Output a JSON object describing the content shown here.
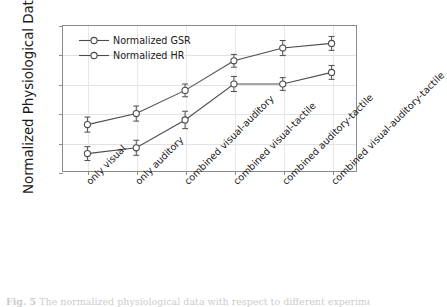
{
  "chart_data": {
    "type": "line",
    "title": "",
    "xlabel": "",
    "ylabel": "Normalized Physiological Data",
    "categories": [
      "only visual",
      "only auditory",
      "combined visual-auditory",
      "combined visual-tactile",
      "combined auditory-tactile",
      "combined visual-auditory-tactile"
    ],
    "series": [
      {
        "name": "Normalized GSR",
        "values": [
          0.08,
          0.099,
          0.139,
          0.19,
          0.212,
          0.22
        ],
        "errors": [
          0.013,
          0.013,
          0.011,
          0.011,
          0.013,
          0.012
        ]
      },
      {
        "name": "Normalized HR",
        "values": [
          0.03,
          0.04,
          0.088,
          0.15,
          0.15,
          0.17
        ],
        "errors": [
          0.012,
          0.013,
          0.015,
          0.013,
          0.011,
          0.012
        ]
      }
    ],
    "ylim": [
      0.0,
      0.25
    ],
    "yticks": [
      "0.00",
      "0.05",
      "0.10",
      "0.15",
      "0.20",
      "0.25"
    ],
    "ytick_values": [
      0.0,
      0.05,
      0.1,
      0.15,
      0.2,
      0.25
    ],
    "grid": true,
    "legend_position": "top-left",
    "marker": "open-circle",
    "line_color": "#4d4d4d",
    "marker_fill": "#ffffff",
    "grid_color": "#e2e2e2",
    "frame_color": "#8a8a8a"
  },
  "caption": {
    "label": "Fig. 5",
    "text": "The normalized physiological data with respect to different experiment"
  }
}
